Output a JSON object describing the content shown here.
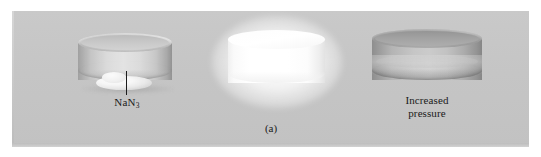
{
  "figure": {
    "caption": "(a)",
    "background_color": "#c5c5c5",
    "page_color": "#ffffff",
    "text_color": "#1a1a1a"
  },
  "labels": {
    "nan3": {
      "text": "NaN3",
      "formula_base": "NaN",
      "formula_subscript": "3",
      "name": "sodium-azide-label"
    },
    "pressure": {
      "line1": "Increased",
      "line2": "pressure",
      "name": "increased-pressure-label"
    }
  },
  "cylinders": [
    {
      "id": "cylinder-a",
      "name": "translucent-cylinder-with-sodium-azide",
      "state": "translucent",
      "fill_color": "#dcdcdc",
      "contents": "NaN3 powder",
      "has_label": true
    },
    {
      "id": "cylinder-b",
      "name": "glowing-white-cylinder",
      "state": "glowing",
      "fill_color": "#ffffff",
      "contents": "flash",
      "has_label": false
    },
    {
      "id": "cylinder-c",
      "name": "pressurized-gray-cylinder",
      "state": "pressurized",
      "fill_color": "#c0c0c0",
      "contents": "nitrogen gas",
      "has_label": true
    }
  ]
}
